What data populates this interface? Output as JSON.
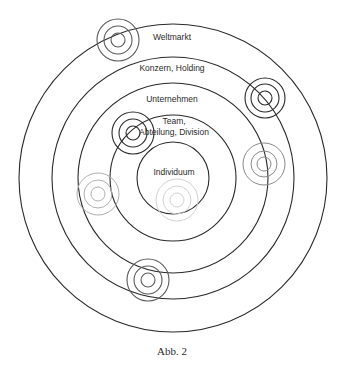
{
  "diagram": {
    "center": {
      "x": 173,
      "y": 178
    },
    "rings": [
      {
        "name": "weltmarkt",
        "label": "Weltmarkt",
        "r": 154,
        "label_x": 172,
        "label_y": 40
      },
      {
        "name": "konzern-holding",
        "label": "Konzern, Holding",
        "r": 121,
        "label_x": 172,
        "label_y": 71
      },
      {
        "name": "unternehmen",
        "label": "Unternehmen",
        "r": 95,
        "label_x": 172,
        "label_y": 102
      },
      {
        "name": "team",
        "label_lines": [
          "Team,",
          "Abteilung, Division"
        ],
        "r": 63,
        "label_x": 174,
        "label_y": 124
      },
      {
        "name": "individuum",
        "label": "Individuum",
        "r": 36,
        "label_x": 174,
        "label_y": 175
      }
    ],
    "targets": [
      {
        "name": "target-weltmarkt",
        "x": 118,
        "y": 40,
        "radii": [
          7,
          14,
          21
        ],
        "color": "#5a5a5a",
        "dark": true
      },
      {
        "name": "target-konzern-right",
        "x": 265,
        "y": 98,
        "radii": [
          7,
          14,
          20
        ],
        "color": "#2a2a2a",
        "dark": true
      },
      {
        "name": "target-team",
        "x": 133,
        "y": 133,
        "radii": [
          7,
          14,
          21
        ],
        "color": "#2a2a2a",
        "dark": true
      },
      {
        "name": "target-unternehmen-right",
        "x": 264,
        "y": 164,
        "radii": [
          7,
          13,
          21
        ],
        "color": "#8a8a8a",
        "dark": false
      },
      {
        "name": "target-konzern-left",
        "x": 98,
        "y": 194,
        "radii": [
          7,
          14,
          21
        ],
        "color": "#b0b0b0",
        "dark": false
      },
      {
        "name": "target-individuum",
        "x": 177,
        "y": 200,
        "radii": [
          7,
          14,
          21
        ],
        "color": "#d2d2d2",
        "dark": false
      },
      {
        "name": "target-unternehmen-bottom",
        "x": 148,
        "y": 280,
        "radii": [
          7,
          14,
          21
        ],
        "color": "#5a5a5a",
        "dark": true
      }
    ],
    "ring_color": "#2a2a2a"
  },
  "caption": "Abb. 2"
}
